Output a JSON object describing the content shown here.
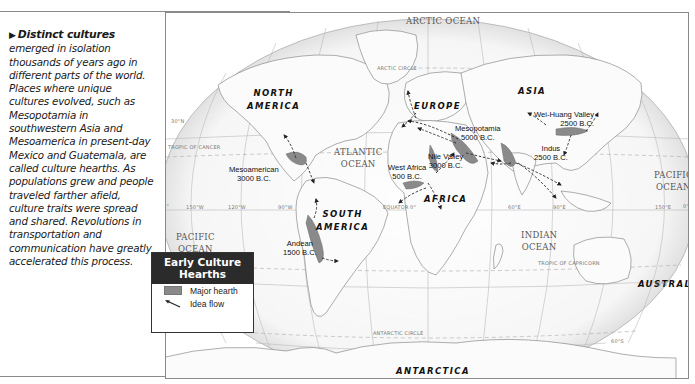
{
  "caption": {
    "lead": "Distinct cultures",
    "body": "emerged in isolation thousands of years ago in different parts of the world. Places where unique cultures evolved, such as Mesopotamia in southwestern Asia and Mesoamerica in present-day Mexico and Guatemala, are called culture hearths. As populations grew and people traveled farther afield, culture traits were spread and shared. Revolutions in transportation and communication have greatly accelerated this process."
  },
  "legend": {
    "title_line1": "Early Culture",
    "title_line2": "Hearths",
    "items": [
      {
        "label": "Major hearth",
        "icon": "hearth-swatch",
        "color": "#8a8a8a"
      },
      {
        "label": "Idea flow",
        "icon": "idea-flow-arrow"
      }
    ]
  },
  "map": {
    "oceans": {
      "arctic": "ARCTIC OCEAN",
      "atlantic": [
        "ATLANTIC",
        "OCEAN"
      ],
      "pacific_west": [
        "PACIFIC",
        "OCEAN"
      ],
      "pacific_east": [
        "PACIFIC",
        "OCEAN"
      ],
      "indian": [
        "INDIAN",
        "OCEAN"
      ]
    },
    "continents": {
      "north_america": [
        "NORTH",
        "AMERICA"
      ],
      "south_america": [
        "SOUTH",
        "AMERICA"
      ],
      "europe": "EUROPE",
      "asia": "ASIA",
      "africa": "AFRICA",
      "australia": "AUSTRALIA",
      "antarctica": "ANTARCTICA"
    },
    "hearths": [
      {
        "name": "Mesoamerican",
        "date": "3000 B.C."
      },
      {
        "name": "Andean",
        "date": "1500 B.C."
      },
      {
        "name": "West Africa",
        "date": "500 B.C."
      },
      {
        "name": "Nile Valley",
        "date": "3000 B.C."
      },
      {
        "name": "Mesopotamia",
        "date": "5000 B.C."
      },
      {
        "name": "Indus",
        "date": "2500 B.C."
      },
      {
        "name": "Wei-Huang Valley",
        "date": "2500 B.C."
      }
    ],
    "grid_labels": {
      "arctic_circle": "ARCTIC CIRCLE",
      "tropic_cancer": "TROPIC OF CANCER",
      "tropic_capricorn": "TROPIC OF CAPRICORN",
      "antarctic_circle": "ANTARCTIC CIRCLE",
      "equator": "EQUATOR",
      "lat_30n": "30°N",
      "lat_30s": "30°S",
      "lat_60s": "60°S",
      "lon_150w": "150°W",
      "lon_120w": "120°W",
      "lon_90w": "90°W",
      "lon_0": "0°",
      "lon_60e": "60°E",
      "lon_90e": "90°E",
      "lon_150e": "150°E",
      "edge_0_left": "0°",
      "edge_0_right": "0°"
    }
  }
}
